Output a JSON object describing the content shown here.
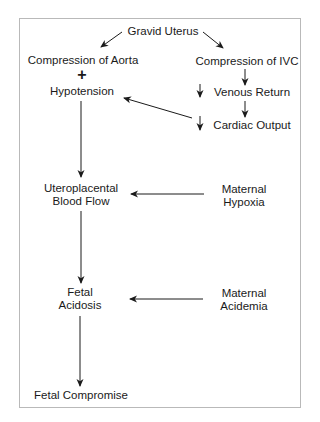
{
  "diagram": {
    "nodes": {
      "gravid_uterus": "Gravid Uterus",
      "compression_aorta": "Compression of Aorta",
      "plus": "+",
      "hypotension": "Hypotension",
      "compression_ivc": "Compression of IVC",
      "venous_return": "Venous Return",
      "cardiac_output": "Cardiac Output",
      "uteroplacental_line1": "Uteroplacental",
      "uteroplacental_line2": "Blood Flow",
      "maternal_hypoxia_line1": "Maternal",
      "maternal_hypoxia_line2": "Hypoxia",
      "fetal_acidosis_line1": "Fetal",
      "fetal_acidosis_line2": "Acidosis",
      "maternal_acidemia_line1": "Maternal",
      "maternal_acidemia_line2": "Acidemia",
      "fetal_compromise": "Fetal Compromise"
    },
    "edges": [
      {
        "from": "Gravid Uterus",
        "to": "Compression of Aorta"
      },
      {
        "from": "Gravid Uterus",
        "to": "Compression of IVC"
      },
      {
        "from": "Compression of IVC",
        "to": "Venous Return (decreased)"
      },
      {
        "from": "Venous Return (decreased)",
        "to": "Cardiac Output (decreased)"
      },
      {
        "from": "Cardiac Output (decreased)",
        "to": "Hypotension"
      },
      {
        "from": "Hypotension",
        "to": "Uteroplacental Blood Flow"
      },
      {
        "from": "Maternal Hypoxia",
        "to": "Uteroplacental Blood Flow"
      },
      {
        "from": "Uteroplacental Blood Flow",
        "to": "Fetal Acidosis"
      },
      {
        "from": "Maternal Acidemia",
        "to": "Fetal Acidosis"
      },
      {
        "from": "Fetal Acidosis",
        "to": "Fetal Compromise"
      }
    ],
    "decrease_indicator": "down-arrow"
  }
}
